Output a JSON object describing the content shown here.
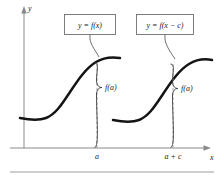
{
  "figure": {
    "kind": "graph-translation-diagram",
    "axes": {
      "y_label": "y",
      "x_label": "x"
    },
    "ticks": [
      {
        "name": "a",
        "label": "a",
        "x": 97
      },
      {
        "name": "a-plus-c",
        "label": "a + c",
        "x": 173
      }
    ],
    "callouts": [
      {
        "name": "original-function",
        "label": "y = f(x)"
      },
      {
        "name": "shifted-function",
        "label": "y = f(x − c)"
      }
    ],
    "value_labels": [
      {
        "name": "fa-left",
        "label": "f(a)"
      },
      {
        "name": "fa-right",
        "label": "f(a)"
      }
    ],
    "colors": {
      "curve": "#141414",
      "axis": "#8a8a8a",
      "dashed": "#9a9a9a",
      "box_border": "#6f6f6f",
      "rule": "#9d9d9d",
      "background": "#ffffff"
    },
    "curves": [
      {
        "name": "curve-original",
        "path": "M 20 118 C 30 120 38 121 46 118 C 56 114 62 104 70 92 C 78 80 86 68 96 62 C 106 56 114 57 120 58"
      },
      {
        "name": "curve-shifted",
        "path": "M 113 120 C 123 122 131 123 139 120 C 149 116 155 106 163 94 C 171 82 179 70 189 64 C 199 58 207 59 212 60"
      }
    ]
  }
}
